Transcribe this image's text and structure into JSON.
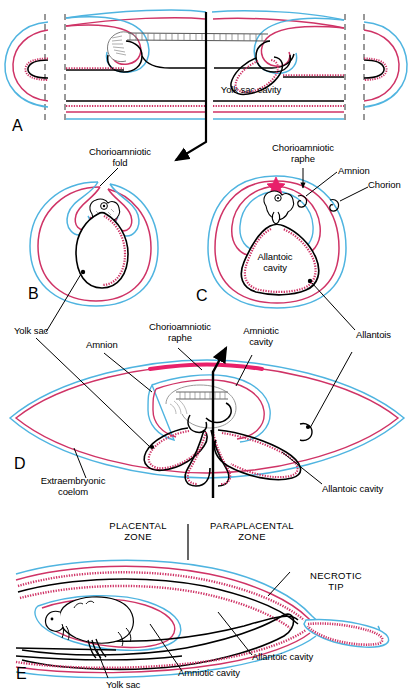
{
  "figure": {
    "panels": [
      {
        "id": "A",
        "letter": "A"
      },
      {
        "id": "B",
        "letter": "B"
      },
      {
        "id": "C",
        "letter": "C"
      },
      {
        "id": "D",
        "letter": "D"
      },
      {
        "id": "E",
        "letter": "E"
      }
    ],
    "labels": {
      "yolk_sac_cavity": "Yolk sac cavity",
      "chorioamniotic_fold": "Chorioamniotic\nfold",
      "chorioamniotic_raphe": "Chorioamniotic\nraphe",
      "amnion": "Amnion",
      "chorion": "Chorion",
      "allantoic_cavity": "Allantoic\ncavity",
      "yolk_sac": "Yolk sac",
      "amnion_d": "Amnion",
      "chorioamniotic_raphe_d": "Chorioamniotic\nraphe",
      "amniotic_cavity": "Amniotic\ncavity",
      "allantois": "Allantois",
      "extraembryonic_coelom": "Extraembryonic\ncoelom",
      "allantoic_cavity_d": "Allantoic cavity",
      "placental_zone": "PLACENTAL\nZONE",
      "paraplacental_zone": "PARAPLACENTAL\nZONE",
      "necrotic_tip": "NECROTIC\nTIP",
      "allantoic_cavity_e": "Allantoic cavity",
      "amniotic_cavity_e": "Amniotic cavity",
      "yolk_sac_e": "Yolk sac"
    },
    "colors": {
      "crimson": "#cf3366",
      "blue": "#4fb4e0",
      "outline": "#000000",
      "background": "#ffffff",
      "raphe_star": "#e8206a",
      "embryo_gray": "#8a8a8a"
    }
  }
}
